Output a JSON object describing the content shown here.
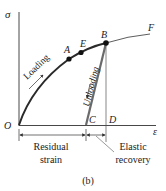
{
  "axes": {
    "y_label": "σ",
    "x_label": "ε",
    "origin_label": "O"
  },
  "points": {
    "A": "A",
    "E": "E",
    "B": "B",
    "F": "F",
    "C": "C",
    "D": "D"
  },
  "annotations": {
    "loading": "Loading",
    "unloading": "Unloading",
    "residual_line1": "Residual",
    "residual_line2": "strain",
    "elastic_line1": "Elastic",
    "elastic_line2": "recovery"
  },
  "caption": "(b)",
  "colors": {
    "curve": "#2a2a2a",
    "unload": "#6a6a6a",
    "axis": "#333333",
    "point": "#111111"
  }
}
